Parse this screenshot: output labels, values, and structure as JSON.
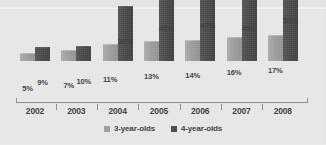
{
  "chart_data": {
    "type": "bar",
    "title": "",
    "subtitle": "",
    "xlabel": "",
    "ylabel": "",
    "ylim": [
      0,
      50
    ],
    "grid": false,
    "legend_position": "bottom-center",
    "categories": [
      "2002",
      "2003",
      "2004",
      "2005",
      "2006",
      "2007",
      "2008"
    ],
    "series": [
      {
        "name": "3-year-olds",
        "color": "#9e9e9e",
        "values": [
          5,
          7,
          11,
          13,
          14,
          16,
          17
        ],
        "labels": [
          "5%",
          "7%",
          "11%",
          "13%",
          "14%",
          "16%",
          "17%"
        ]
      },
      {
        "name": "4-year-olds",
        "color": "#4a4a4a",
        "values": [
          9,
          10,
          36,
          45,
          47,
          45,
          50
        ],
        "labels": [
          "9%",
          "10%",
          "36%",
          "45%",
          "47%",
          "45%",
          "50%"
        ]
      }
    ]
  },
  "legend": {
    "entries": [
      {
        "label": "3-year-olds",
        "swatch": "series-3-year-olds-swatch"
      },
      {
        "label": "4-year-olds",
        "swatch": "series-4-year-olds-swatch"
      }
    ]
  },
  "axis": {
    "years": [
      "2002",
      "2003",
      "2004",
      "2005",
      "2006",
      "2007",
      "2008"
    ]
  },
  "colors": {
    "background": "#e9e9e9",
    "series_3_year_olds": "#9e9e9e",
    "series_4_year_olds": "#4a4a4a",
    "axis_line": "#8d8d8d",
    "label_text": "#3b3b3b"
  }
}
